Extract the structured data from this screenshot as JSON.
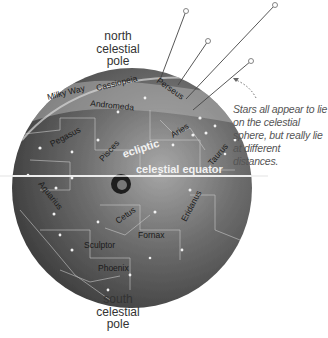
{
  "diagram": {
    "title": "Celestial sphere",
    "colors": {
      "background": "#ffffff",
      "sphere_dark": "#3a3a3a",
      "sphere_light": "#9a9a9a",
      "milky_way": "#b5b5b5",
      "grid_lines": "#cfcfcf",
      "equator": "#f2f2f2",
      "text_dark": "#222222",
      "text_light": "#f5f5f5",
      "note_text": "#555555"
    },
    "labels": {
      "north_pole": [
        "north",
        "celestial",
        "pole"
      ],
      "south_pole": [
        "south",
        "celestial",
        "pole"
      ],
      "celestial_equator": "celestial equator",
      "ecliptic": "ecliptic",
      "note": "Stars all appear to lie on the celestial sphere, but really lie at different distances."
    },
    "constellations": [
      {
        "name": "Milky Way",
        "x": 48,
        "y": 100,
        "rot": -14
      },
      {
        "name": "Cassiopeia",
        "x": 98,
        "y": 88,
        "rot": -14
      },
      {
        "name": "Perseus",
        "x": 160,
        "y": 82,
        "rot": 35
      },
      {
        "name": "Andromeda",
        "x": 90,
        "y": 106,
        "rot": 6
      },
      {
        "name": "Pegasus",
        "x": 50,
        "y": 143,
        "rot": -28
      },
      {
        "name": "Pisces",
        "x": 100,
        "y": 160,
        "rot": -48
      },
      {
        "name": "Aries",
        "x": 176,
        "y": 131,
        "rot": -32
      },
      {
        "name": "Taurus",
        "x": 213,
        "y": 162,
        "rot": -50
      },
      {
        "name": "Aquarius",
        "x": 38,
        "y": 196,
        "rot": 52
      },
      {
        "name": "Cetus",
        "x": 114,
        "y": 220,
        "rot": -35
      },
      {
        "name": "Fornax",
        "x": 140,
        "y": 240,
        "rot": 0
      },
      {
        "name": "Eridanus",
        "x": 182,
        "y": 220,
        "rot": -62
      },
      {
        "name": "Sculptor",
        "x": 84,
        "y": 245,
        "rot": 0
      },
      {
        "name": "Phoenix",
        "x": 98,
        "y": 268,
        "rot": 0
      }
    ],
    "star_pointers": [
      {
        "x1": 160,
        "y1": 80,
        "x2": 186,
        "y2": 11
      },
      {
        "x1": 178,
        "y1": 85,
        "x2": 208,
        "y2": 41
      },
      {
        "x1": 186,
        "y1": 99,
        "x2": 275,
        "y2": 5
      },
      {
        "x1": 193,
        "y1": 110,
        "x2": 251,
        "y2": 61
      }
    ]
  }
}
